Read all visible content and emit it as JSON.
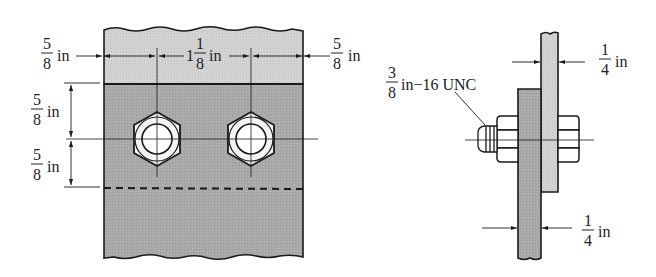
{
  "figure": {
    "type": "bolted-joint-drawing",
    "front_view": {
      "dims": {
        "left_edge": {
          "num": "5",
          "den": "8",
          "unit": "in"
        },
        "bolt_spacing": {
          "whole": "1",
          "num": "1",
          "den": "8",
          "unit": "in"
        },
        "right_edge": {
          "num": "5",
          "den": "8",
          "unit": "in"
        },
        "top_to_center": {
          "num": "5",
          "den": "8",
          "unit": "in"
        },
        "center_to_overlap": {
          "num": "5",
          "den": "8",
          "unit": "in"
        }
      },
      "bolt_count": 2
    },
    "side_view": {
      "thread_callout": {
        "num": "3",
        "den": "8",
        "rest": "in−16 UNC"
      },
      "top_plate_thickness": {
        "num": "1",
        "den": "4",
        "unit": "in"
      },
      "bottom_plate_thickness": {
        "num": "1",
        "den": "4",
        "unit": "in"
      }
    },
    "colors": {
      "light_plate": "#d2d2d2",
      "dark_plate": "#a6a6a6",
      "line": "#1a1a1a",
      "bolt_face": "#f4f4f4"
    }
  }
}
